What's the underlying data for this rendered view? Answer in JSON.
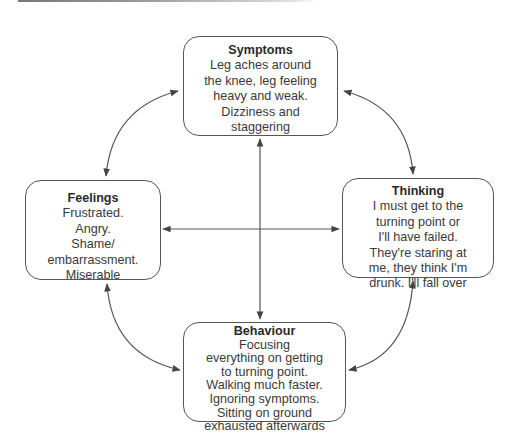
{
  "diagram": {
    "type": "cognitive-behavioural-cycle",
    "nodes": {
      "symptoms": {
        "title": "Symptoms",
        "lines": [
          "Leg aches around",
          "the knee, leg feeling",
          "heavy and weak.",
          "Dizziness and",
          "staggering"
        ]
      },
      "feelings": {
        "title": "Feelings",
        "lines": [
          "Frustrated.",
          "Angry.",
          "Shame/",
          "embarrassment.",
          "Miserable"
        ]
      },
      "thinking": {
        "title": "Thinking",
        "lines": [
          "I must get to the",
          "turning point or",
          "I'll have failed.",
          "They're staring at",
          "me, they think I'm",
          "drunk. I'll fall over"
        ]
      },
      "behaviour": {
        "title": "Behaviour",
        "lines": [
          "Focusing",
          "everything on getting",
          "to turning point.",
          "Walking much faster.",
          "Ignoring symptoms.",
          "Sitting on ground",
          "exhausted afterwards"
        ]
      }
    },
    "edges": [
      {
        "from": "symptoms",
        "to": "feelings",
        "style": "curved",
        "bidirectional": true
      },
      {
        "from": "symptoms",
        "to": "thinking",
        "style": "curved",
        "bidirectional": true
      },
      {
        "from": "feelings",
        "to": "behaviour",
        "style": "curved",
        "bidirectional": true
      },
      {
        "from": "thinking",
        "to": "behaviour",
        "style": "curved",
        "bidirectional": true
      },
      {
        "from": "symptoms",
        "to": "behaviour",
        "style": "straight-vertical",
        "bidirectional": true
      },
      {
        "from": "feelings",
        "to": "thinking",
        "style": "straight-horizontal",
        "bidirectional": true
      }
    ],
    "colors": {
      "stroke": "#555555",
      "text": "#3a3a3a",
      "background": "#ffffff"
    }
  }
}
